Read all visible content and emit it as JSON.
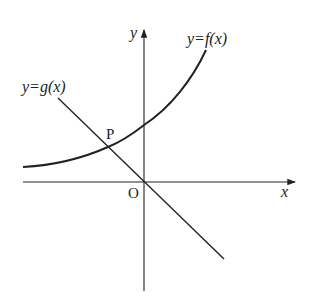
{
  "diagram": {
    "type": "function-graph",
    "axes": {
      "x_label": "x",
      "y_label": "y",
      "origin_label": "O"
    },
    "curves": [
      {
        "name": "f",
        "label": "y=f(x)",
        "shape": "increasing exponential-like curve, above x-axis"
      },
      {
        "name": "g",
        "label": "y=g(x)",
        "shape": "decreasing straight line through origin"
      }
    ],
    "points": [
      {
        "label": "P",
        "description": "intersection of y=f(x) and y=g(x) in second quadrant"
      }
    ],
    "colors": {
      "stroke": "#222222",
      "background": "#ffffff"
    }
  }
}
